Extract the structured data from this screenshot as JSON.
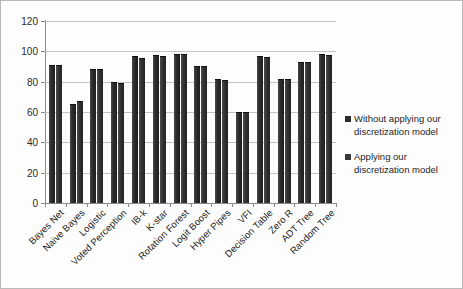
{
  "chart_data": {
    "type": "bar",
    "title": "",
    "xlabel": "",
    "ylabel": "",
    "ylim": [
      0,
      120
    ],
    "yticks": [
      0,
      20,
      40,
      60,
      80,
      100,
      120
    ],
    "grid": true,
    "legend_position": "right",
    "categories": [
      "Bayes Net",
      "Naive Bayes",
      "Logistic",
      "Voted Perception",
      "IB-k",
      "K-star",
      "Rotation Forest",
      "Logit Boost",
      "Hyper Pipes",
      "VFI",
      "Decision Table",
      "Zero R",
      "ADT Tree",
      "Random Tree"
    ],
    "series": [
      {
        "name": "Without applying our discretization model",
        "color": "#2c2c2c",
        "values": [
          91,
          65,
          88.5,
          80,
          97,
          97.5,
          98,
          90.5,
          82,
          60,
          97,
          82,
          93,
          98
        ]
      },
      {
        "name": "Applying our discretization model",
        "color": "#3a3a3a",
        "values": [
          91,
          67.5,
          88.5,
          79,
          95.5,
          97,
          98,
          90.5,
          81,
          60,
          96.5,
          82,
          93,
          97.5
        ]
      }
    ]
  },
  "legend": {
    "entries": [
      {
        "line1": "Without applying our",
        "line2": "discretization model"
      },
      {
        "line1": "Applying our",
        "line2": "discretization model"
      }
    ]
  }
}
